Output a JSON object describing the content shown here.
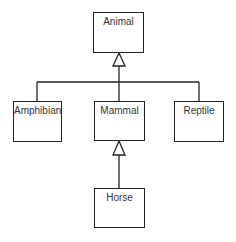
{
  "diagram": {
    "type": "UML class inheritance",
    "classes": [
      {
        "id": "animal",
        "name": "Animal"
      },
      {
        "id": "amphibian",
        "name": "Amphibian"
      },
      {
        "id": "mammal",
        "name": "Mammal"
      },
      {
        "id": "reptile",
        "name": "Reptile"
      },
      {
        "id": "horse",
        "name": "Horse"
      }
    ],
    "generalizations": [
      {
        "child": "Amphibian",
        "parent": "Animal"
      },
      {
        "child": "Mammal",
        "parent": "Animal"
      },
      {
        "child": "Reptile",
        "parent": "Animal"
      },
      {
        "child": "Horse",
        "parent": "Mammal"
      }
    ]
  }
}
